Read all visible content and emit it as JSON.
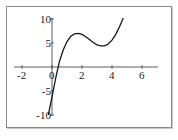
{
  "chart_data": {
    "type": "line",
    "title": "",
    "xlabel": "",
    "ylabel": "",
    "xlim": [
      -2.3,
      7
    ],
    "ylim": [
      -10.2,
      10.5
    ],
    "grid": false,
    "legend": null,
    "x_ticks": [
      "-2",
      "0",
      "2",
      "4",
      "6"
    ],
    "y_ticks": [
      "10",
      "5",
      "-5",
      "-10"
    ],
    "series": [
      {
        "name": "f(x)",
        "color": "#1a1a1a",
        "x": [
          -0.25,
          0.0,
          0.25,
          0.5,
          0.75,
          1.0,
          1.25,
          1.5,
          1.75,
          2.0,
          2.25,
          2.5,
          2.75,
          3.0,
          3.25,
          3.5,
          3.75,
          4.0,
          4.25,
          4.5,
          4.75
        ],
        "y": [
          -10.0,
          -6.2,
          -2.2,
          1.2,
          3.6,
          5.3,
          6.4,
          6.9,
          7.0,
          6.8,
          6.3,
          5.7,
          5.1,
          4.6,
          4.4,
          4.4,
          4.8,
          5.6,
          6.8,
          8.4,
          10.2
        ]
      }
    ]
  },
  "axes": {
    "x_tick_labels": [
      "-2",
      "0",
      "2",
      "4",
      "6"
    ],
    "y_tick_labels": [
      "10",
      "5",
      "-5",
      "-10"
    ]
  }
}
